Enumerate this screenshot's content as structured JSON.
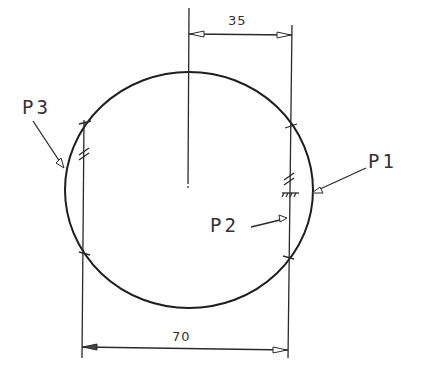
{
  "drawing": {
    "dimensions": {
      "top": "35",
      "bottom": "70"
    },
    "labels": {
      "p1": "P1",
      "p2": "P2",
      "p3": "P3"
    },
    "colors": {
      "line": "#2a2a2a",
      "background": "#ffffff"
    }
  }
}
